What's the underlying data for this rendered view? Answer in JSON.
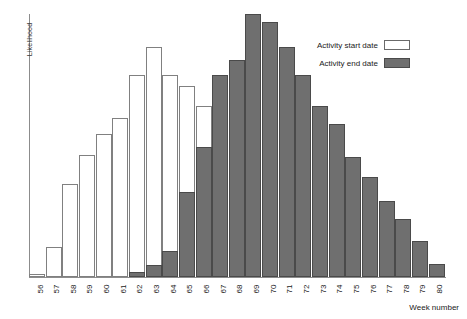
{
  "chart_data": {
    "type": "bar",
    "title": "",
    "xlabel": "Week number",
    "ylabel": "Likelihood",
    "grid": false,
    "legend_position": "top-right",
    "axis_ranges": {
      "ylim": [
        0,
        1.0
      ],
      "xlim_categories": [
        "56",
        "80"
      ]
    },
    "categories": [
      "56",
      "57",
      "58",
      "59",
      "60",
      "61",
      "62",
      "63",
      "64",
      "65",
      "66",
      "67",
      "68",
      "69",
      "70",
      "71",
      "72",
      "73",
      "74",
      "75",
      "76",
      "77",
      "78",
      "79",
      "80"
    ],
    "series": [
      {
        "name": "Activity start date",
        "style": "hollow-white",
        "values": [
          0.012,
          0.115,
          0.355,
          0.462,
          0.545,
          0.605,
          0.768,
          0.875,
          0.768,
          0.728,
          0.65,
          0,
          0,
          0,
          0,
          0,
          0,
          0,
          0,
          0,
          0,
          0,
          0,
          0,
          0
        ]
      },
      {
        "name": "Activity end date",
        "style": "filled-gray",
        "values": [
          0,
          0,
          0,
          0,
          0,
          0,
          0.019,
          0.046,
          0.1,
          0.325,
          0.495,
          0.768,
          0.826,
          1.0,
          0.97,
          0.875,
          0.768,
          0.65,
          0.583,
          0.455,
          0.382,
          0.29,
          0.222,
          0.135,
          0.05
        ]
      }
    ],
    "colors": {
      "start_fill": "#ffffff",
      "start_stroke": "#808080",
      "end_fill": "#6f6f6f",
      "end_stroke": "#4a4a4a",
      "axis": "#8c8c8c",
      "text": "#1a1a1a"
    }
  },
  "legend": {
    "items": [
      {
        "label": "Activity start date",
        "swatch": "start"
      },
      {
        "label": "Activity end date",
        "swatch": "end"
      }
    ]
  }
}
